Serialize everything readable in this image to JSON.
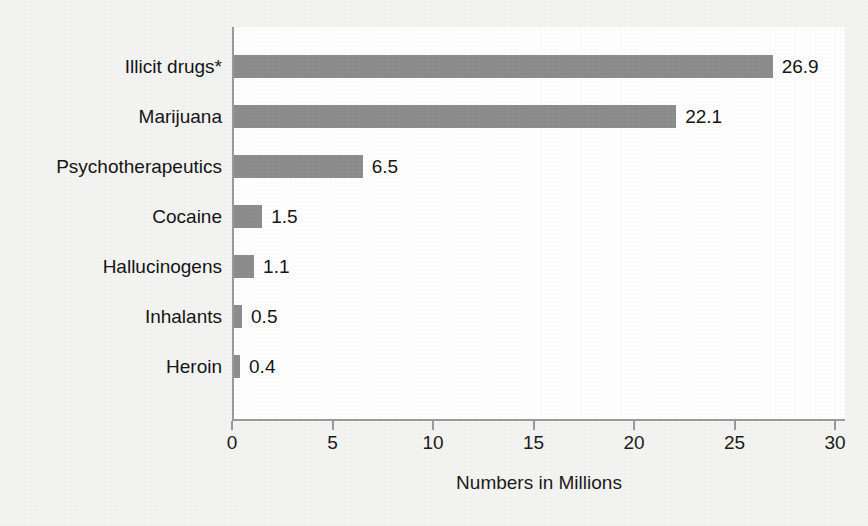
{
  "chart_data": {
    "type": "bar",
    "orientation": "horizontal",
    "title": "",
    "xlabel": "Numbers in Millions",
    "ylabel": "",
    "categories": [
      "Illicit drugs*",
      "Marijuana",
      "Psychotherapeutics",
      "Cocaine",
      "Hallucinogens",
      "Inhalants",
      "Heroin"
    ],
    "values": [
      26.9,
      22.1,
      6.5,
      1.5,
      1.1,
      0.5,
      0.4
    ],
    "value_labels": [
      "26.9",
      "22.1",
      "6.5",
      "1.5",
      "1.1",
      "0.5",
      "0.4"
    ],
    "xlim": [
      0,
      30
    ],
    "xticks": [
      0,
      5,
      10,
      15,
      20,
      25,
      30
    ],
    "xtick_labels": [
      "0",
      "5",
      "10",
      "15",
      "20",
      "25",
      "30"
    ],
    "grid": false,
    "legend": null,
    "bar_color": "#8d8d8d",
    "axis_color": "#9a9a9a",
    "text_color": "#151515",
    "plot_background": "#ffffff",
    "figure_background": "#f4f4f2"
  }
}
